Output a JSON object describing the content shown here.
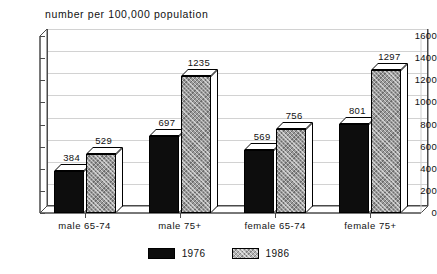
{
  "chart_data": {
    "type": "bar",
    "title": "number per 100,000 population",
    "xlabel": "",
    "ylabel": "",
    "ylim": [
      0,
      1600
    ],
    "ytick_step": 200,
    "yticks": [
      "1600",
      "1400",
      "1200",
      "1000",
      "800",
      "600",
      "400",
      "200",
      "0"
    ],
    "grid": true,
    "legend_position": "bottom-center",
    "style": "3d-column",
    "categories": [
      "male 65-74",
      "male 75+",
      "female 65-74",
      "female 75+"
    ],
    "series": [
      {
        "name": "1976",
        "color": "#0d0d0d",
        "pattern": "solid-black",
        "values": [
          384,
          697,
          569,
          801
        ]
      },
      {
        "name": "1986",
        "color": "#9a9a9a",
        "pattern": "gray-hatch",
        "values": [
          529,
          1235,
          756,
          1297
        ]
      }
    ],
    "data_labels": [
      [
        "384",
        "697",
        "569",
        "801"
      ],
      [
        "529",
        "1235",
        "756",
        "1297"
      ]
    ]
  },
  "legend": {
    "items": [
      {
        "label": "1976"
      },
      {
        "label": "1986"
      }
    ]
  }
}
